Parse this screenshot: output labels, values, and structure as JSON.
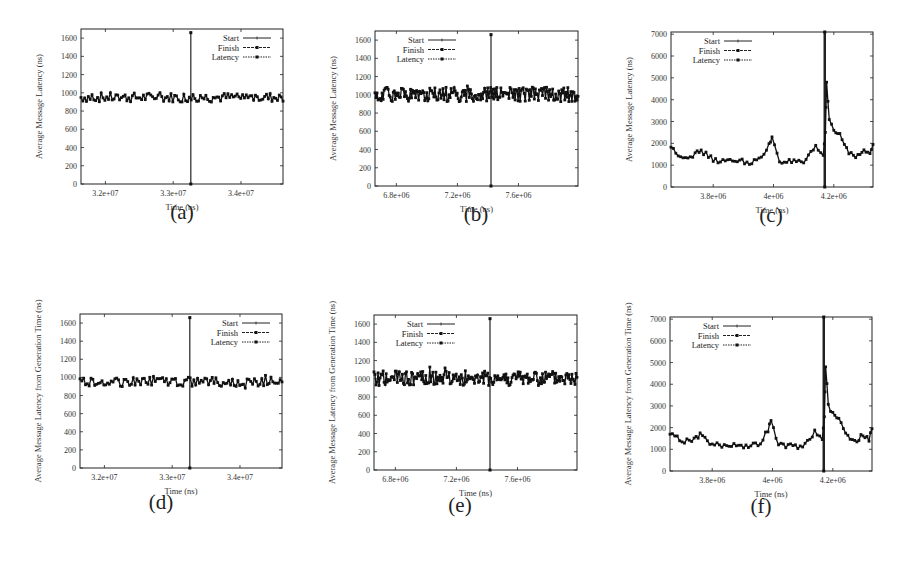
{
  "figure": {
    "panels": [
      {
        "id": "a",
        "caption": "(a)",
        "ylabel": "Average Message Latency (ns)",
        "xlabel": "Time (ns)"
      },
      {
        "id": "b",
        "caption": "(b)",
        "ylabel": "Average Message Latency (ns)",
        "xlabel": "Time (ns)"
      },
      {
        "id": "c",
        "caption": "(c)",
        "ylabel": "Average Message Latency (ns)",
        "xlabel": "Time (ns)"
      },
      {
        "id": "d",
        "caption": "(d)",
        "ylabel": "Average Message Latency from Generation Time (ns)",
        "xlabel": "Time (ns)"
      },
      {
        "id": "e",
        "caption": "(e)",
        "ylabel": "Average Message Latency from Generation Time (ns)",
        "xlabel": "Time (ns)"
      },
      {
        "id": "f",
        "caption": "(f)",
        "ylabel": "Average Message Latency from Generation Time (ns)",
        "xlabel": "Time (ns)"
      }
    ],
    "legend": [
      "Start",
      "Finish",
      "Latency"
    ]
  },
  "chart_data": [
    {
      "panel": "a",
      "type": "line",
      "title": "",
      "xlabel": "Time (ns)",
      "ylabel": "Average Message Latency (ns)",
      "xlim": [
        31640000,
        34620000
      ],
      "ylim": [
        0,
        1700
      ],
      "xticks": [
        32000000,
        33000000,
        34000000
      ],
      "xtick_labels": [
        "3.2e+07",
        "3.3e+07",
        "3.4e+07"
      ],
      "yticks": [
        0,
        200,
        400,
        600,
        800,
        1000,
        1200,
        1400,
        1600
      ],
      "legend": [
        "Start",
        "Finish",
        "Latency"
      ],
      "legend_position": "top-right",
      "grid": false,
      "vertical_marker_x": 33260000,
      "vertical_marker_height": 1660,
      "series": [
        {
          "name": "Latency",
          "mean": 950,
          "range": [
            880,
            1010
          ],
          "n_points": 110
        }
      ]
    },
    {
      "panel": "b",
      "type": "line",
      "title": "",
      "xlabel": "Time (ns)",
      "ylabel": "Average Message Latency (ns)",
      "xlim": [
        6660000,
        7990000
      ],
      "ylim": [
        0,
        1700
      ],
      "xticks": [
        6800000,
        7200000,
        7600000
      ],
      "xtick_labels": [
        "6.8e+06",
        "7.2e+06",
        "7.6e+06"
      ],
      "yticks": [
        0,
        200,
        400,
        600,
        800,
        1000,
        1200,
        1400,
        1600
      ],
      "legend": [
        "Start",
        "Finish",
        "Latency"
      ],
      "legend_position": "top-left",
      "grid": false,
      "vertical_marker_x": 7420000,
      "vertical_marker_height": 1660,
      "series": [
        {
          "name": "Latency",
          "mean": 1005,
          "range": [
            910,
            1110
          ],
          "n_points": 200
        }
      ]
    },
    {
      "panel": "c",
      "type": "line",
      "title": "",
      "xlabel": "Time (ns)",
      "ylabel": "Average Message Latency (ns)",
      "xlim": [
        3660000,
        4330000
      ],
      "ylim": [
        0,
        7100
      ],
      "xticks": [
        3800000,
        4000000,
        4200000
      ],
      "xtick_labels": [
        "3.8e+06",
        "4e+06",
        "4.2e+06"
      ],
      "yticks": [
        0,
        1000,
        2000,
        3000,
        4000,
        5000,
        6000,
        7000
      ],
      "legend": [
        "Start",
        "Finish",
        "Latency"
      ],
      "legend_position": "top-left",
      "grid": false,
      "vertical_marker_x": 4170000,
      "vertical_marker_height": 7100,
      "series": [
        {
          "name": "Latency",
          "x": [
            3660000,
            3700000,
            3740000,
            3760000,
            3800000,
            3840000,
            3880000,
            3920000,
            3960000,
            3985000,
            3995000,
            4020000,
            4060000,
            4100000,
            4140000,
            4165000,
            4172000,
            4176000,
            4185000,
            4200000,
            4220000,
            4250000,
            4280000,
            4300000,
            4320000,
            4330000
          ],
          "y": [
            1800,
            1350,
            1500,
            1650,
            1250,
            1150,
            1250,
            1100,
            1300,
            1900,
            2300,
            1200,
            1150,
            1100,
            1800,
            1450,
            2500,
            4800,
            3100,
            2600,
            2400,
            1600,
            1400,
            1700,
            1450,
            1950
          ]
        }
      ]
    },
    {
      "panel": "d",
      "type": "line",
      "title": "",
      "xlabel": "Time (ns)",
      "ylabel": "Average Message Latency from Generation Time (ns)",
      "xlim": [
        31640000,
        34620000
      ],
      "ylim": [
        0,
        1700
      ],
      "xticks": [
        32000000,
        33000000,
        34000000
      ],
      "xtick_labels": [
        "3.2e+07",
        "3.3e+07",
        "3.4e+07"
      ],
      "yticks": [
        0,
        200,
        400,
        600,
        800,
        1000,
        1200,
        1400,
        1600
      ],
      "legend": [
        "Start",
        "Finish",
        "Latency"
      ],
      "legend_position": "top-right",
      "grid": false,
      "vertical_marker_x": 33260000,
      "vertical_marker_height": 1660,
      "series": [
        {
          "name": "Latency",
          "mean": 950,
          "range": [
            880,
            1010
          ],
          "n_points": 110
        }
      ]
    },
    {
      "panel": "e",
      "type": "line",
      "title": "",
      "xlabel": "Time (ns)",
      "ylabel": "Average Message Latency from Generation Time (ns)",
      "xlim": [
        6660000,
        7990000
      ],
      "ylim": [
        0,
        1700
      ],
      "xticks": [
        6800000,
        7200000,
        7600000
      ],
      "xtick_labels": [
        "6.8e+06",
        "7.2e+06",
        "7.6e+06"
      ],
      "yticks": [
        0,
        200,
        400,
        600,
        800,
        1000,
        1200,
        1400,
        1600
      ],
      "legend": [
        "Start",
        "Finish",
        "Latency"
      ],
      "legend_position": "top-left",
      "grid": false,
      "vertical_marker_x": 7420000,
      "vertical_marker_height": 1660,
      "series": [
        {
          "name": "Latency",
          "mean": 1005,
          "range": [
            910,
            1110
          ],
          "n_points": 200
        }
      ]
    },
    {
      "panel": "f",
      "type": "line",
      "title": "",
      "xlabel": "Time (ns)",
      "ylabel": "Average Message Latency from Generation Time (ns)",
      "xlim": [
        3660000,
        4330000
      ],
      "ylim": [
        0,
        7100
      ],
      "xticks": [
        3800000,
        4000000,
        4200000
      ],
      "xtick_labels": [
        "3.8e+06",
        "4e+06",
        "4.2e+06"
      ],
      "yticks": [
        0,
        1000,
        2000,
        3000,
        4000,
        5000,
        6000,
        7000
      ],
      "legend": [
        "Start",
        "Finish",
        "Latency"
      ],
      "legend_position": "top-left",
      "grid": false,
      "vertical_marker_x": 4170000,
      "vertical_marker_height": 7100,
      "series": [
        {
          "name": "Latency",
          "x": [
            3660000,
            3700000,
            3740000,
            3760000,
            3800000,
            3840000,
            3880000,
            3920000,
            3960000,
            3985000,
            3995000,
            4020000,
            4060000,
            4100000,
            4140000,
            4165000,
            4172000,
            4176000,
            4185000,
            4200000,
            4220000,
            4250000,
            4280000,
            4300000,
            4320000,
            4330000
          ],
          "y": [
            1800,
            1350,
            1500,
            1650,
            1250,
            1150,
            1250,
            1100,
            1300,
            1900,
            2300,
            1200,
            1150,
            1100,
            1800,
            1450,
            2500,
            4800,
            3100,
            2600,
            2400,
            1600,
            1400,
            1700,
            1450,
            1950
          ]
        }
      ]
    }
  ]
}
